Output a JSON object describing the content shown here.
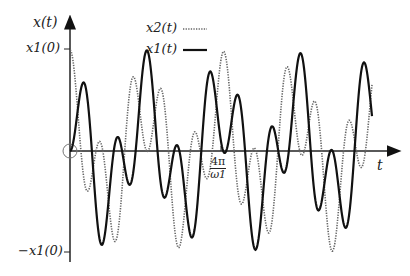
{
  "chart_data": {
    "type": "line",
    "title": "",
    "xlabel": "t",
    "ylabel": "x(t)",
    "x_ticks": [
      {
        "value": "4π/ω1",
        "label": "4π/ω1"
      }
    ],
    "y_ticks": [
      {
        "value": 1,
        "label": "x1(0)"
      },
      {
        "value": -1,
        "label": "-x1(0)"
      }
    ],
    "ylim": [
      -1,
      1
    ],
    "grid": false,
    "legend": {
      "position": "top-center",
      "entries": [
        "x2(t)",
        "x1(t)"
      ]
    },
    "annotations": [
      "circle marker at origin"
    ],
    "series": [
      {
        "name": "x1(t)",
        "style": "solid",
        "start_value": 0
      },
      {
        "name": "x2(t)",
        "style": "dotted",
        "start_value": 1
      }
    ],
    "model": {
      "omega_ratio": 2.45,
      "tmax_over_4pi_w1": 2.0
    }
  },
  "labels": {
    "y_axis": "x(t)",
    "x_axis": "t",
    "ytick_top": "x1(0)",
    "ytick_bottom": "−x1(0)",
    "xtick_num": "4π",
    "xtick_den": "ω1",
    "legend_x2": "x2(t)",
    "legend_x1": "x1(t)"
  }
}
